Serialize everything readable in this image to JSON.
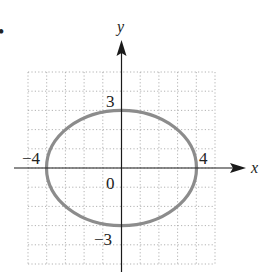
{
  "bullet": "•",
  "chart_data": {
    "type": "line",
    "title": "",
    "equation": "x^2/16 + y^2/9 = 1",
    "xlabel": "x",
    "ylabel": "y",
    "xlim": [
      -5,
      5
    ],
    "ylim": [
      -5,
      5
    ],
    "grid": true,
    "grid_style": "dotted",
    "series": [
      {
        "name": "ellipse",
        "color": "#8a8a8a",
        "center": [
          0,
          0
        ],
        "semi_major_x": 4,
        "semi_minor_y": 3
      }
    ],
    "tick_labels": {
      "x": [
        "-4",
        "4"
      ],
      "y": [
        "3",
        "-3"
      ],
      "origin": "0"
    }
  },
  "labels": {
    "x_axis": "x",
    "y_axis": "y",
    "x_neg": "−4",
    "x_pos": "4",
    "y_pos": "3",
    "y_neg": "−3",
    "origin": "0"
  },
  "colors": {
    "axis": "#1a1a1a",
    "grid": "#9a9a9a",
    "curve": "#8a8a8a"
  }
}
